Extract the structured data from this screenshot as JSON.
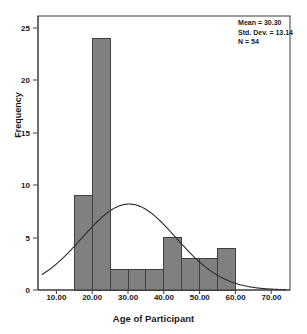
{
  "chart_data": {
    "type": "bar",
    "title": "",
    "subtitle": "",
    "xlabel": "Age of Participant",
    "ylabel": "Frequency",
    "xlim": [
      6,
      74
    ],
    "ylim": [
      0,
      26.5
    ],
    "grid": false,
    "legend": null,
    "bin_width": 5,
    "bin_edges": [
      15,
      20,
      25,
      30,
      35,
      40,
      45,
      50,
      55,
      60
    ],
    "bin_centers": [
      17.5,
      22.5,
      27.5,
      32.5,
      37.5,
      42.5,
      47.5,
      52.5,
      57.5
    ],
    "categories": [
      "15-20",
      "20-25",
      "25-30",
      "30-35",
      "35-40",
      "40-45",
      "45-50",
      "50-55",
      "55-60"
    ],
    "values": [
      9,
      24,
      2,
      2,
      2,
      5,
      3,
      3,
      4
    ],
    "bar_color": "#808080",
    "bar_edge_color": "#404040",
    "xticks": [
      10,
      20,
      30,
      40,
      50,
      60,
      70
    ],
    "xtick_labels": [
      "10.00",
      "20.00",
      "30.00",
      "40.00",
      "50.00",
      "60.00",
      "70.00"
    ],
    "yticks": [
      0,
      5,
      10,
      15,
      20,
      25
    ],
    "ytick_labels": [
      "0",
      "5",
      "10",
      "15",
      "20",
      "25"
    ],
    "overlay": {
      "type": "normal_curve",
      "mean": 30.3,
      "std_dev": 13.14,
      "n": 54,
      "peak_value": 8.2,
      "color": "#2b2b2b"
    }
  },
  "stats": {
    "mean_line": "Mean = 30.30",
    "std_dev_line": "Std. Dev. = 13.14",
    "n_line": "N = 54"
  },
  "axes": {
    "x_title": "Age of Participant",
    "y_title": "Frequency",
    "x_labels": [
      "10.00",
      "20.00",
      "30.00",
      "40.00",
      "50.00",
      "60.00",
      "70.00"
    ],
    "y_labels": [
      "0",
      "5",
      "10",
      "15",
      "20",
      "25"
    ]
  }
}
